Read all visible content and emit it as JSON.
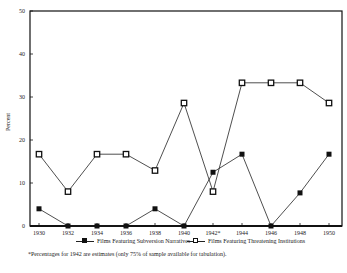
{
  "chart_data": {
    "type": "line",
    "title": "",
    "xlabel": "",
    "ylabel": "Percent",
    "ylim": [
      0,
      50
    ],
    "yticks": [
      0,
      10,
      20,
      30,
      40,
      50
    ],
    "grid": false,
    "legend_position": "bottom",
    "categories": [
      "1930",
      "1932",
      "1934",
      "1936",
      "1938",
      "1940",
      "1942*",
      "1944",
      "1946",
      "1948",
      "1950"
    ],
    "series": [
      {
        "name": "Films Featuring Subversion Narratives",
        "marker": "filled-square",
        "values": [
          4,
          0,
          0,
          0,
          4,
          0,
          12.5,
          16.7,
          0,
          7.7,
          16.7
        ]
      },
      {
        "name": "Films Featuring Threatening Institutions",
        "marker": "open-square",
        "values": [
          16.7,
          8,
          16.7,
          16.7,
          12.9,
          28.6,
          8,
          33.3,
          33.3,
          33.3,
          28.6
        ]
      }
    ],
    "annotations": [
      "*Percentages for 1942 are estimates (only 75% of sample available for tabulation)."
    ]
  },
  "legend": {
    "items": [
      {
        "label": "Films Featuring Subversion Narratives",
        "marker": "filled-square"
      },
      {
        "label": "Films Featuring Threatening Institutions",
        "marker": "open-square"
      }
    ]
  },
  "footnote": "*Percentages for 1942 are estimates (only 75% of sample available for tabulation).",
  "colors": {
    "line": "#222222",
    "axis": "#111111",
    "background": "#ffffff"
  }
}
